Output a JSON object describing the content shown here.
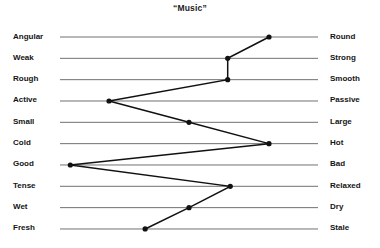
{
  "chart_data": {
    "type": "line",
    "title": "“Music”",
    "xlabel": "",
    "ylabel": "",
    "orientation": "horizontal-semantic-differential",
    "grid": false,
    "legend": "none",
    "xlim": [
      0,
      1
    ],
    "axis_note": "Each row is a bipolar scale; value 0 = left adjective pole, 1 = right adjective pole",
    "categories": [
      "Angular – Round",
      "Weak – Strong",
      "Rough – Smooth",
      "Active – Passive",
      "Small – Large",
      "Cold – Hot",
      "Good – Bad",
      "Tense – Relaxed",
      "Wet – Dry",
      "Fresh – Stale"
    ],
    "left_labels": [
      "Angular",
      "Weak",
      "Rough",
      "Active",
      "Small",
      "Cold",
      "Good",
      "Tense",
      "Wet",
      "Fresh"
    ],
    "right_labels": [
      "Round",
      "Strong",
      "Smooth",
      "Passive",
      "Large",
      "Hot",
      "Bad",
      "Relaxed",
      "Dry",
      "Stale"
    ],
    "values": [
      0.81,
      0.65,
      0.65,
      0.19,
      0.5,
      0.81,
      0.04,
      0.66,
      0.5,
      0.33
    ],
    "series": [
      {
        "name": "“Music” profile",
        "values": [
          0.81,
          0.65,
          0.65,
          0.19,
          0.5,
          0.81,
          0.04,
          0.66,
          0.5,
          0.33
        ]
      }
    ],
    "colors": {
      "profile_line": "#111111",
      "scale_line": "#4d4d4d",
      "text": "#141414",
      "background": "#ffffff"
    }
  }
}
